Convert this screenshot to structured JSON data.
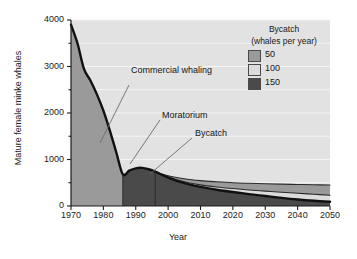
{
  "chart_data": {
    "type": "area",
    "title": "",
    "xlabel": "Year",
    "ylabel": "Mature female minke whales",
    "xlim": [
      1970,
      2050
    ],
    "ylim": [
      0,
      4000
    ],
    "xticks": [
      "1970",
      "1980",
      "1990",
      "2000",
      "2010",
      "2020",
      "2030",
      "2040",
      "2050"
    ],
    "yticks": [
      "0",
      "1000",
      "2000",
      "3000",
      "4000"
    ],
    "yminor": [
      500,
      1500,
      2500,
      3500
    ],
    "grid": "horizontal",
    "legend": {
      "title_line1": "Bycatch",
      "title_line2": "(whales per year)",
      "position": "top-right",
      "entries": [
        {
          "label": "50",
          "color": "#9a9a9a"
        },
        {
          "label": "100",
          "color": "#dcdcdc"
        },
        {
          "label": "150",
          "color": "#4a4a4a"
        }
      ]
    },
    "annotations": [
      {
        "label": "Commercial whaling",
        "x": 1990,
        "y": 2850
      },
      {
        "label": "Moratorium",
        "x": 1998,
        "y": 1530
      },
      {
        "label": "Bycatch",
        "x": 2010,
        "y": 1160
      }
    ],
    "series": [
      {
        "name": "Population (historic + bycatch 150)",
        "bycatch": 150,
        "color": "#4a4a4a",
        "x": [
          1970,
          1972,
          1974,
          1976,
          1978,
          1980,
          1982,
          1984,
          1986,
          1988,
          1990,
          1992,
          1994,
          1996,
          2000,
          2005,
          2010,
          2015,
          2020,
          2025,
          2030,
          2035,
          2040,
          2045,
          2050
        ],
        "y": [
          3900,
          3500,
          2950,
          2700,
          2400,
          2050,
          1620,
          1150,
          680,
          760,
          810,
          820,
          790,
          740,
          610,
          490,
          410,
          350,
          300,
          255,
          215,
          175,
          140,
          112,
          90
        ]
      },
      {
        "name": "Bycatch 100",
        "bycatch": 100,
        "color": "#dcdcdc",
        "x": [
          1996,
          2000,
          2005,
          2010,
          2015,
          2020,
          2025,
          2030,
          2035,
          2040,
          2045,
          2050
        ],
        "y": [
          740,
          625,
          520,
          455,
          410,
          375,
          345,
          320,
          295,
          275,
          252,
          230
        ]
      },
      {
        "name": "Bycatch 50",
        "bycatch": 50,
        "color": "#9a9a9a",
        "x": [
          1996,
          2000,
          2005,
          2010,
          2015,
          2020,
          2025,
          2030,
          2035,
          2040,
          2045,
          2050
        ],
        "y": [
          740,
          650,
          585,
          545,
          520,
          500,
          488,
          478,
          470,
          463,
          456,
          450
        ]
      }
    ],
    "periods": [
      {
        "name": "Commercial whaling",
        "start": 1970,
        "end": 1986,
        "fill": "#9a9a9a"
      },
      {
        "name": "Moratorium",
        "start": 1986,
        "end": 1996,
        "fill": "#4a4a4a"
      },
      {
        "name": "Bycatch",
        "start": 1996,
        "end": 2050,
        "fill": "#4a4a4a"
      }
    ]
  }
}
